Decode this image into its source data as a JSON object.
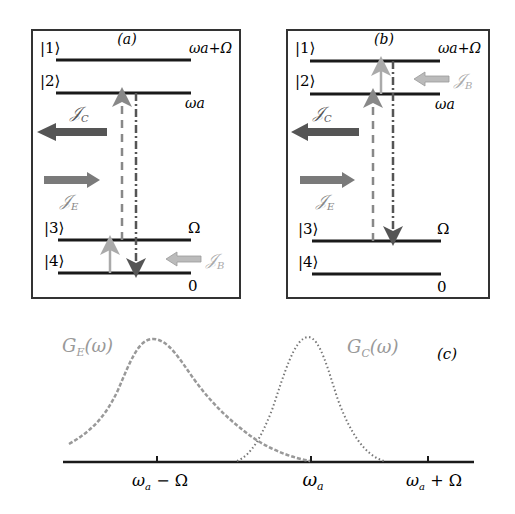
{
  "panel_a": {
    "label": "(a)",
    "levels": [
      {
        "ket": "|1⟩",
        "energy": "ωa+Ω"
      },
      {
        "ket": "|2⟩",
        "energy": "ωa"
      },
      {
        "ket": "|3⟩",
        "energy": "Ω"
      },
      {
        "ket": "|4⟩",
        "energy": "0"
      }
    ],
    "currents": {
      "jc": {
        "symbol": "𝒥",
        "sub": "C",
        "direction": "left"
      },
      "je": {
        "symbol": "𝒥",
        "sub": "E",
        "direction": "right"
      },
      "jb": {
        "symbol": "𝒥",
        "sub": "B",
        "direction": "left"
      }
    },
    "transitions": [
      {
        "style": "dashed",
        "from": "|4⟩",
        "to": "|2⟩",
        "color": "#888888"
      },
      {
        "style": "dash-dot",
        "from": "|2⟩",
        "to": "|4⟩",
        "color": "#555555"
      },
      {
        "style": "solid",
        "from": "|4⟩",
        "to": "|3⟩",
        "color": "#aaaaaa"
      }
    ]
  },
  "panel_b": {
    "label": "(b)",
    "levels": [
      {
        "ket": "|1⟩",
        "energy": "ωa+Ω"
      },
      {
        "ket": "|2⟩",
        "energy": "ωa"
      },
      {
        "ket": "|3⟩",
        "energy": "Ω"
      },
      {
        "ket": "|4⟩",
        "energy": "0"
      }
    ],
    "currents": {
      "jc": {
        "symbol": "𝒥",
        "sub": "C",
        "direction": "left"
      },
      "je": {
        "symbol": "𝒥",
        "sub": "E",
        "direction": "right"
      },
      "jb": {
        "symbol": "𝒥",
        "sub": "B",
        "direction": "left"
      }
    },
    "transitions": [
      {
        "style": "dashed",
        "from": "|3⟩",
        "to": "|2⟩",
        "color": "#888888"
      },
      {
        "style": "solid",
        "from": "|2⟩",
        "to": "|1⟩",
        "color": "#aaaaaa"
      },
      {
        "style": "dash-dot",
        "from": "|1⟩",
        "to": "|3⟩",
        "color": "#555555"
      }
    ]
  },
  "panel_c": {
    "label": "(c)",
    "curves": [
      {
        "name": "G",
        "sub": "E",
        "arg": "(ω)",
        "style": "dashed",
        "color": "#999999"
      },
      {
        "name": "G",
        "sub": "C",
        "arg": "(ω)",
        "style": "dotted",
        "color": "#777777"
      }
    ],
    "ticks": [
      {
        "main": "ω",
        "sub": "a",
        "suffix": " − Ω"
      },
      {
        "main": "ω",
        "sub": "a",
        "suffix": ""
      },
      {
        "main": "ω",
        "sub": "a",
        "suffix": " + Ω"
      }
    ]
  },
  "colors": {
    "line": "#1a1a1a",
    "jc_arrow": "#555555",
    "je_arrow": "#7a7a7a",
    "jb_arrow": "#aaaaaa",
    "label_gray": "#999999"
  }
}
